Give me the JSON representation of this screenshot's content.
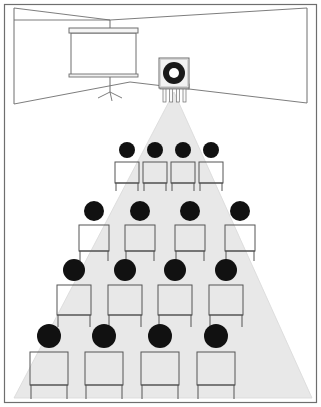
{
  "figure": {
    "name": "projection-room-perspective-diagram",
    "width": 321,
    "height": 407,
    "background_color": "#ffffff",
    "border_color": "#6e6e6e"
  },
  "colors": {
    "line": "#6e6e6e",
    "line_dark": "#555555",
    "light_cone": "#e8e8e8",
    "light_cone_edge": "#d8d8d8",
    "head_fill": "#111111",
    "screen_fill": "#ffffff",
    "projector_fill": "#f2f2f2",
    "projector_lens_outer": "#1a1a1a",
    "projector_lens_inner": "#ffffff",
    "wall_fill": "#ffffff",
    "floor_fill": "#ffffff"
  },
  "room": {
    "name": "room-perspective",
    "ceiling_vanishing": {
      "x": 110,
      "y": 20
    },
    "back_wall": {
      "left_x": 14,
      "right_x": 307,
      "top_y": 20,
      "bottom_y": 82
    },
    "ceiling_left_corner": {
      "x": 14,
      "y": 8
    },
    "ceiling_right_corner": {
      "x": 307,
      "y": 8
    },
    "floor_left_corner": {
      "x": 14,
      "y": 104
    },
    "floor_right_corner": {
      "x": 307,
      "y": 103
    }
  },
  "projection_screen": {
    "name": "projection-screen",
    "label": "Projection screen",
    "x": 71,
    "y": 33,
    "width": 65,
    "height": 43,
    "header_bar_height": 5,
    "tripod": {
      "name": "screen-tripod",
      "pole_x": 110,
      "pole_top_y": 20,
      "pole_bottom_y": 92,
      "leg_spread": 12,
      "leg_bottom_y": 98
    }
  },
  "projector": {
    "name": "projector",
    "label": "Projector",
    "body": {
      "x": 159,
      "y": 58,
      "width": 30,
      "height": 30
    },
    "lens": {
      "cx": 174,
      "cy": 73,
      "outer_r": 11,
      "inner_r": 5
    },
    "stand": {
      "x": 162,
      "y": 88,
      "width": 25,
      "height": 12
    },
    "legs": 4
  },
  "light_cone": {
    "name": "projector-light-cone",
    "label": "Light beam",
    "apex": {
      "x": 174,
      "y": 92
    },
    "left_base": {
      "x": 14,
      "y": 398
    },
    "right_base": {
      "x": 312,
      "y": 398
    },
    "fill": "#e8e8e8",
    "opacity": 1
  },
  "audience": {
    "name": "audience-rows",
    "label": "Seated audience",
    "row_count": 4,
    "seats_per_row": 4,
    "rows": [
      {
        "name": "audience-row-1",
        "label": "Row 1 (back)",
        "head_radius": 8,
        "head_cy": 150,
        "chair_top_y": 162,
        "chair_width": 24,
        "chair_height": 21,
        "leg_length": 8,
        "seats": [
          {
            "name": "seat-r1-c1",
            "cx": 127
          },
          {
            "name": "seat-r1-c2",
            "cx": 155
          },
          {
            "name": "seat-r1-c3",
            "cx": 183
          },
          {
            "name": "seat-r1-c4",
            "cx": 211
          }
        ]
      },
      {
        "name": "audience-row-2",
        "label": "Row 2",
        "head_radius": 10,
        "head_cy": 211,
        "chair_top_y": 225,
        "chair_width": 30,
        "chair_height": 26,
        "leg_length": 10,
        "seats": [
          {
            "name": "seat-r2-c1",
            "cx": 94
          },
          {
            "name": "seat-r2-c2",
            "cx": 140
          },
          {
            "name": "seat-r2-c3",
            "cx": 190
          },
          {
            "name": "seat-r2-c4",
            "cx": 240
          }
        ]
      },
      {
        "name": "audience-row-3",
        "label": "Row 3",
        "head_radius": 11,
        "head_cy": 270,
        "chair_top_y": 285,
        "chair_width": 34,
        "chair_height": 30,
        "leg_length": 12,
        "seats": [
          {
            "name": "seat-r3-c1",
            "cx": 74
          },
          {
            "name": "seat-r3-c2",
            "cx": 125
          },
          {
            "name": "seat-r3-c3",
            "cx": 175
          },
          {
            "name": "seat-r3-c4",
            "cx": 226
          }
        ]
      },
      {
        "name": "audience-row-4",
        "label": "Row 4 (front)",
        "head_radius": 12,
        "head_cy": 336,
        "chair_top_y": 352,
        "chair_width": 38,
        "chair_height": 33,
        "leg_length": 14,
        "seats": [
          {
            "name": "seat-r4-c1",
            "cx": 49
          },
          {
            "name": "seat-r4-c2",
            "cx": 104
          },
          {
            "name": "seat-r4-c3",
            "cx": 160
          },
          {
            "name": "seat-r4-c4",
            "cx": 216
          }
        ]
      }
    ]
  }
}
